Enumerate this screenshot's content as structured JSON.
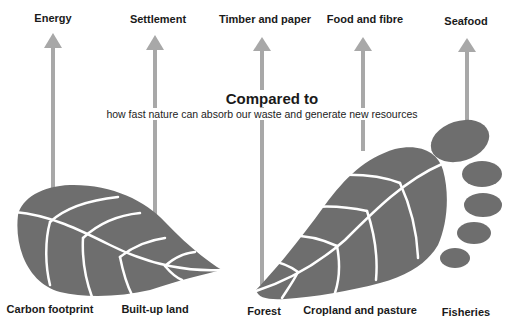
{
  "diagram": {
    "title": "Compared to",
    "subtitle": "how fast nature can absorb our waste and generate new resources",
    "colors": {
      "footprint_fill": "#6e6e6e",
      "vein_stroke": "#ffffff",
      "arrow_fill": "#a8a8a8",
      "text": "#1a1a1a",
      "background": "#ffffff"
    },
    "demand_labels": [
      {
        "id": "energy",
        "label": "Energy"
      },
      {
        "id": "settlement",
        "label": "Settlement"
      },
      {
        "id": "timber",
        "label": "Timber and paper"
      },
      {
        "id": "food",
        "label": "Food and fibre"
      },
      {
        "id": "seafood",
        "label": "Seafood"
      }
    ],
    "supply_labels": [
      {
        "id": "carbon",
        "label": "Carbon footprint"
      },
      {
        "id": "builtup",
        "label": "Built-up land"
      },
      {
        "id": "forest",
        "label": "Forest"
      },
      {
        "id": "cropland",
        "label": "Cropland and pasture"
      },
      {
        "id": "fisheries",
        "label": "Fisheries"
      }
    ]
  }
}
